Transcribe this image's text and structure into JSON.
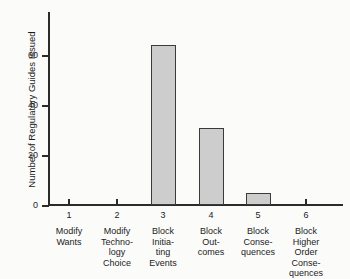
{
  "chart_data": {
    "type": "bar",
    "title": "",
    "xlabel": "",
    "ylabel": "Number of Regulatory Guides Issued",
    "ylim": [
      0,
      70
    ],
    "yticks": [
      0,
      20,
      40,
      60
    ],
    "ytick_labels": [
      "0",
      "20",
      "40",
      "60"
    ],
    "xticks": [
      1,
      2,
      3,
      4,
      5,
      6
    ],
    "xtick_labels": [
      "1",
      "2",
      "3",
      "4",
      "5",
      "6"
    ],
    "grid": false,
    "legend": false,
    "categories": [
      "Modify\nWants",
      "Modify\nTechno-\nlogy\nChoice",
      "Block\nInitia-\nting\nEvents",
      "Block\nOut-\ncomes",
      "Block\nConse-\nquences",
      "Block\nHigher\nOrder\nConse-\nquences"
    ],
    "values": [
      0,
      0,
      64,
      31,
      5,
      0
    ],
    "bar_fill_color": "#cdcdcd",
    "bar_edge_color": "#3a3a3a",
    "axis_color": "#2b2b2b",
    "background_color": "#fbfbfa"
  }
}
